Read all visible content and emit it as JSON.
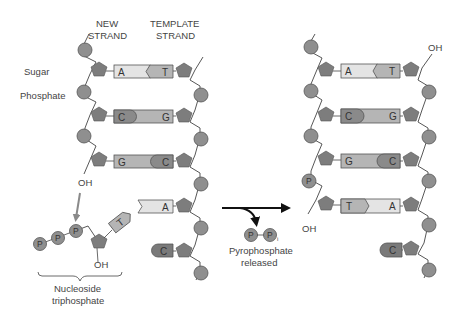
{
  "labels": {
    "new_strand_1": "NEW",
    "new_strand_2": "STRAND",
    "template_strand_1": "TEMPLATE",
    "template_strand_2": "STRAND",
    "sugar": "Sugar",
    "phosphate": "Phosphate",
    "oh": "OH",
    "nucleoside_1": "Nucleoside",
    "nucleoside_2": "triphosphate",
    "pyro_1": "Pyrophosphate",
    "pyro_2": "released",
    "p": "P",
    "pi_sub": "i"
  },
  "left_molecule": {
    "pairs": [
      {
        "new": "A",
        "template": "T"
      },
      {
        "new": "C",
        "template": "G"
      },
      {
        "new": "G",
        "template": "C"
      },
      {
        "new": "",
        "template": "A"
      },
      {
        "new": "",
        "template": "C"
      }
    ],
    "incoming_nucleotide": "T"
  },
  "right_molecule": {
    "pairs": [
      {
        "new": "A",
        "template": "T"
      },
      {
        "new": "C",
        "template": "G"
      },
      {
        "new": "G",
        "template": "C"
      },
      {
        "new": "T",
        "template": "A"
      },
      {
        "new": "",
        "template": "C"
      }
    ]
  },
  "colors": {
    "phosphate": "#8f8f8f",
    "sugar": "#7d7d7d",
    "base_light": "#e4e4e4",
    "base_mid": "#b5b5b5",
    "base_dark": "#8a8a8a",
    "arrow_gray": "#8a8a8a",
    "arrow_black": "#111111"
  }
}
